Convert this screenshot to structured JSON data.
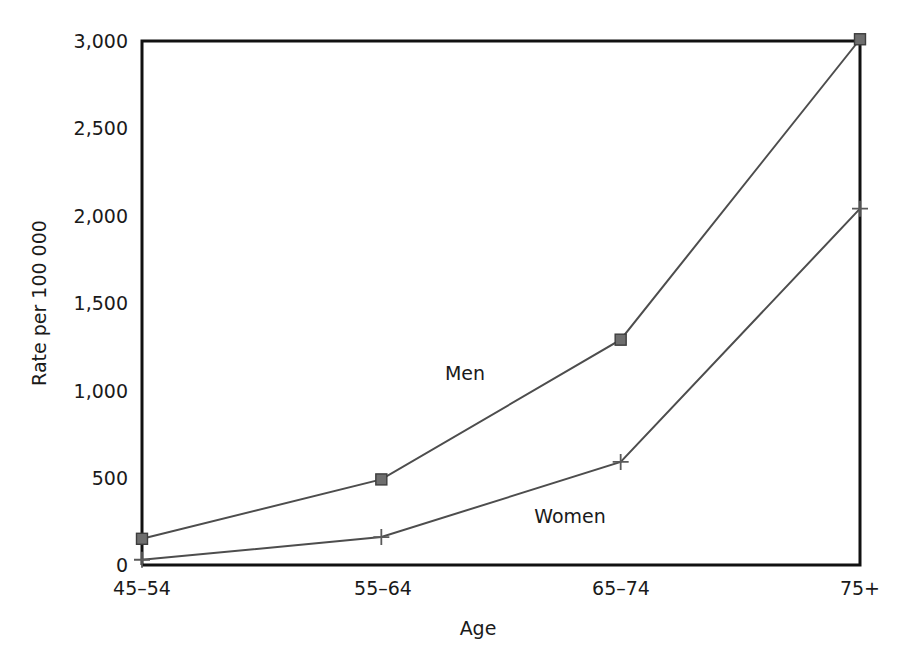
{
  "chart_data": {
    "type": "line",
    "title": "",
    "subtitle": "",
    "xlabel": "Age",
    "ylabel": "Rate per 100 000",
    "categories": [
      "45–54",
      "55–64",
      "65–74",
      "75+"
    ],
    "series": [
      {
        "name": "Men",
        "values": [
          150,
          490,
          1290,
          3010
        ],
        "marker": "filled-square",
        "color": "#6e6e6e"
      },
      {
        "name": "Women",
        "values": [
          30,
          160,
          590,
          2040
        ],
        "marker": "plus",
        "color": "#5a5a5a"
      }
    ],
    "ylim": [
      0,
      3000
    ],
    "yticks": [
      0,
      500,
      1000,
      1500,
      2000,
      2500,
      3000
    ],
    "ytick_labels": [
      "0",
      "500",
      "1,000",
      "1,500",
      "2,000",
      "2,500",
      "3,000"
    ],
    "grid": false,
    "legend_position": "inline-annotations",
    "annotations": [
      {
        "text": "Men",
        "x_frac": 0.455,
        "value": 1740
      },
      {
        "text": "Women",
        "x_frac": 0.615,
        "value": 960
      }
    ]
  },
  "axes": {
    "y_tick_labels": [
      "3,000",
      "2,500",
      "2,000",
      "1,500",
      "1,000",
      "500",
      "0"
    ],
    "x_tick_labels": [
      "45–54",
      "55–64",
      "65–74",
      "75+"
    ],
    "y_axis_title": "Rate per 100 000",
    "x_axis_title": "Age"
  },
  "colors": {
    "axis": "#111111",
    "men_line": "#4d4d4d",
    "men_marker": "#6e6e6e",
    "women_line": "#4d4d4d",
    "women_marker": "#5a5a5a",
    "background": "#ffffff"
  }
}
